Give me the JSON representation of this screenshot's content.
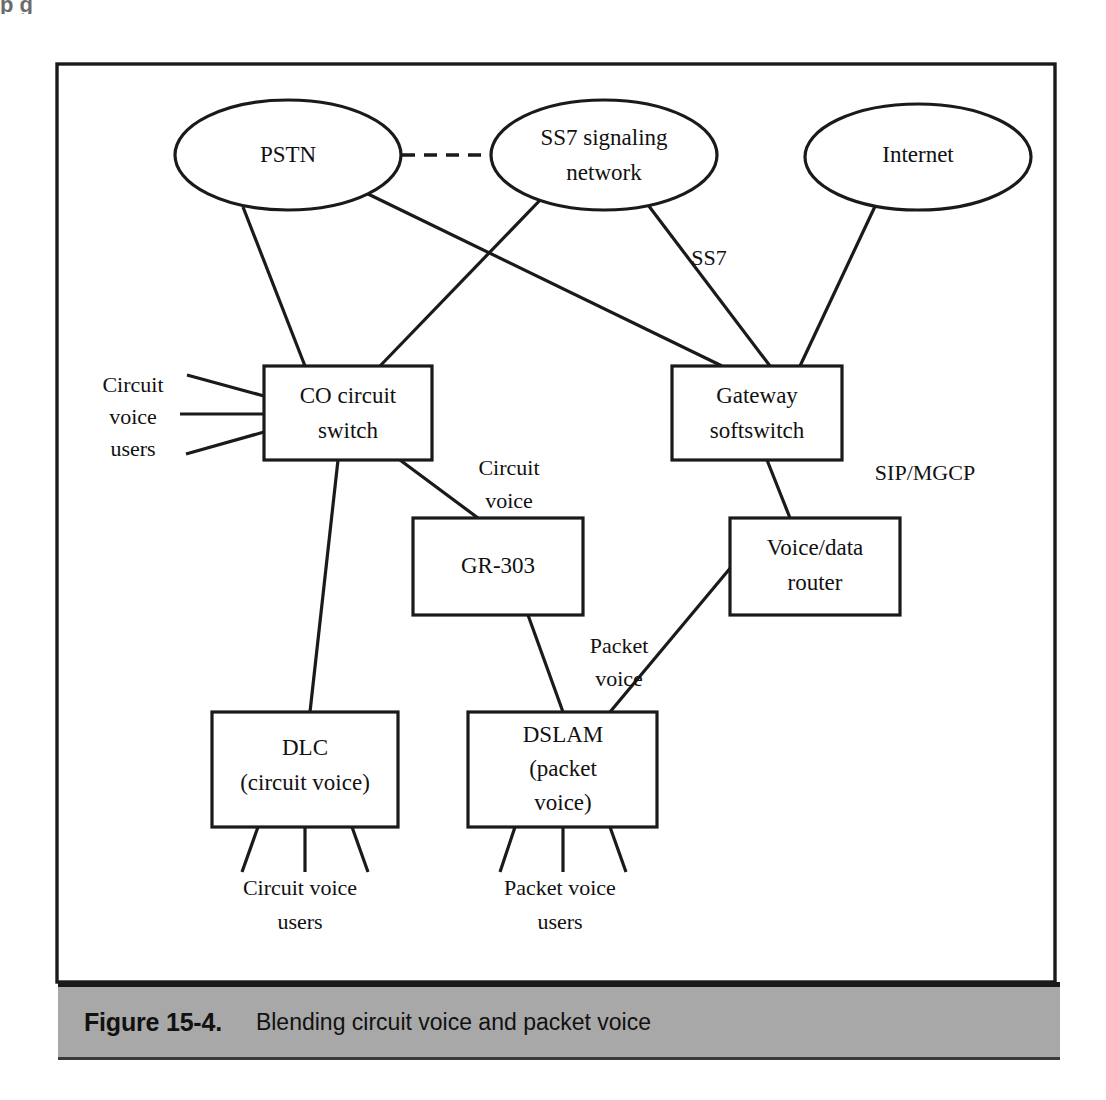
{
  "figure": {
    "number_label": "Figure 15-4.",
    "caption": "Blending circuit voice and packet voice",
    "cropped_header_fragment": "p g"
  },
  "diagram": {
    "title": "Blending circuit voice and packet voice",
    "ellipses": [
      {
        "id": "pstn",
        "label": "PSTN",
        "cx": 288,
        "cy": 155,
        "rx": 113,
        "ry": 55
      },
      {
        "id": "ss7",
        "label_line1": "SS7 signaling",
        "label_line2": "network",
        "cx": 604,
        "cy": 155,
        "rx": 113,
        "ry": 55
      },
      {
        "id": "internet",
        "label": "Internet",
        "cx": 918,
        "cy": 157,
        "rx": 113,
        "ry": 53
      }
    ],
    "boxes": [
      {
        "id": "co-circuit-switch",
        "label_line1": "CO circuit",
        "label_line2": "switch",
        "x": 264,
        "y": 366,
        "w": 168,
        "h": 94
      },
      {
        "id": "gateway-softswitch",
        "label_line1": "Gateway",
        "label_line2": "softswitch",
        "x": 672,
        "y": 366,
        "w": 170,
        "h": 94
      },
      {
        "id": "gr-303",
        "label_line1": "GR-303",
        "label_line2": "",
        "x": 413,
        "y": 518,
        "w": 170,
        "h": 97
      },
      {
        "id": "voice-data-router",
        "label_line1": "Voice/data",
        "label_line2": "router",
        "x": 730,
        "y": 518,
        "w": 170,
        "h": 97
      },
      {
        "id": "dlc",
        "label_line1": "DLC",
        "label_line2": "(circuit voice)",
        "label_line3": "",
        "x": 212,
        "y": 712,
        "w": 186,
        "h": 115
      },
      {
        "id": "dslam",
        "label_line1": "DSLAM",
        "label_line2": "(packet",
        "label_line3": "voice)",
        "x": 468,
        "y": 712,
        "w": 189,
        "h": 115
      }
    ],
    "edge_labels": [
      {
        "id": "ss7-link-label",
        "text": "SS7",
        "x": 709,
        "y": 265
      },
      {
        "id": "sip-mgcp-label",
        "text": "SIP/MGCP",
        "x": 925,
        "y": 480
      },
      {
        "id": "circuit-voice-link-label-l1",
        "text": "Circuit",
        "x": 509,
        "y": 475
      },
      {
        "id": "circuit-voice-link-label-l2",
        "text": "voice",
        "x": 509,
        "y": 508
      },
      {
        "id": "packet-voice-link-label-l1",
        "text": "Packet",
        "x": 619,
        "y": 653
      },
      {
        "id": "packet-voice-link-label-l2",
        "text": "voice",
        "x": 619,
        "y": 686
      }
    ],
    "side_labels": [
      {
        "id": "circuit-voice-users-left-l1",
        "text": "Circuit",
        "x": 133,
        "y": 392
      },
      {
        "id": "circuit-voice-users-left-l2",
        "text": "voice",
        "x": 133,
        "y": 424
      },
      {
        "id": "circuit-voice-users-left-l3",
        "text": "users",
        "x": 133,
        "y": 456
      },
      {
        "id": "circuit-voice-users-bottom-l1",
        "text": "Circuit voice",
        "x": 300,
        "y": 895
      },
      {
        "id": "circuit-voice-users-bottom-l2",
        "text": "users",
        "x": 300,
        "y": 929
      },
      {
        "id": "packet-voice-users-bottom-l1",
        "text": "Packet voice",
        "x": 560,
        "y": 895
      },
      {
        "id": "packet-voice-users-bottom-l2",
        "text": "users",
        "x": 560,
        "y": 929
      }
    ],
    "colors": {
      "stroke": "#1a1a1a",
      "fill": "#ffffff",
      "caption_bar": "#a8a8a8"
    }
  }
}
